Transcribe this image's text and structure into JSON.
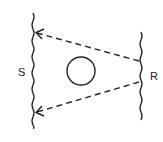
{
  "diagram": {
    "labels": {
      "left": "S",
      "right": "R"
    },
    "elements": {
      "left_boundary": "wavy vertical line",
      "right_boundary": "wavy vertical line",
      "obstacle": "circle",
      "upper_path": "dashed arrow from R to S",
      "lower_path": "dashed arrow from R to S"
    },
    "colors": {
      "stroke": "#222222",
      "background": "#ffffff"
    }
  }
}
